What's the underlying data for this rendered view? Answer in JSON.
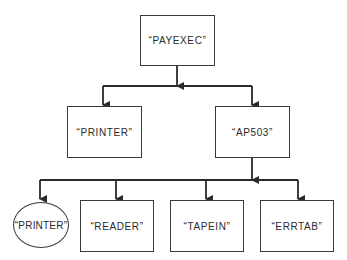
{
  "diagram": {
    "type": "hierarchy-tree",
    "colors": {
      "line": "#3a3a3a",
      "text": "#2a2a2a",
      "background": "#ffffff"
    },
    "root": {
      "id": "payexec",
      "label": "“PAYEXEC”",
      "shape": "rectangle"
    },
    "level1": [
      {
        "id": "printer",
        "label": "“PRINTER”",
        "shape": "rectangle"
      },
      {
        "id": "ap503",
        "label": "“AP503”",
        "shape": "rectangle"
      }
    ],
    "level2": [
      {
        "id": "printer-2",
        "label": "“PRINTER”",
        "shape": "ellipse"
      },
      {
        "id": "reader",
        "label": "“READER”",
        "shape": "rectangle"
      },
      {
        "id": "tapein",
        "label": "“TAPEIN”",
        "shape": "rectangle"
      },
      {
        "id": "errtab",
        "label": "“ERRTAB”",
        "shape": "rectangle"
      }
    ],
    "edges": [
      {
        "from": "payexec",
        "to": "printer"
      },
      {
        "from": "payexec",
        "to": "ap503"
      },
      {
        "from": "ap503",
        "to": "printer-2"
      },
      {
        "from": "ap503",
        "to": "reader"
      },
      {
        "from": "ap503",
        "to": "tapein"
      },
      {
        "from": "ap503",
        "to": "errtab"
      }
    ]
  }
}
